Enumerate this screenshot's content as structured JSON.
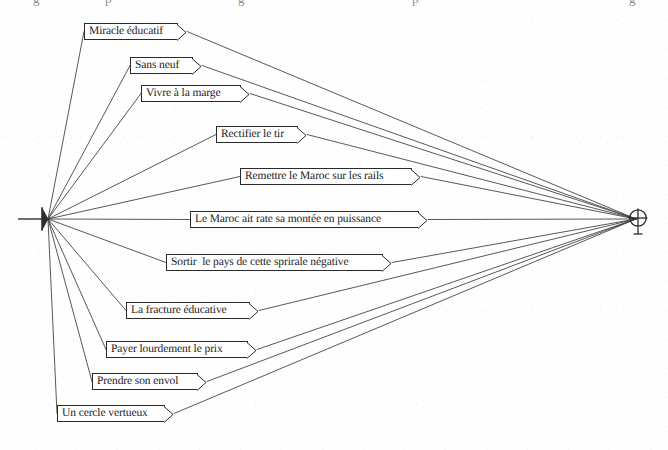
{
  "diagram": {
    "type": "radial-link-diagram",
    "title": "",
    "source_node": {
      "name": "left-hub",
      "symbol": "converging-arrow",
      "x": 45,
      "y": 219
    },
    "target_node": {
      "name": "right-hub",
      "symbol": "circle-plus",
      "label": "⊕",
      "x": 638,
      "y": 219
    },
    "edge_color": "#3a3a3a",
    "box_border_color": "#2a2a2a",
    "box_fill_color": "#ffffff",
    "text_color": "#1a1a1a",
    "background_color": "#fefefe",
    "nodes": [
      {
        "id": "n1",
        "label": "Miracle éducatif",
        "x": 84,
        "y": 23,
        "width": 94
      },
      {
        "id": "n2",
        "label": "Sans neuf",
        "x": 130,
        "y": 57,
        "width": 63
      },
      {
        "id": "n3",
        "label": "Vivre à la marge",
        "x": 141,
        "y": 85,
        "width": 100
      },
      {
        "id": "n4",
        "label": "Rectifier le tir",
        "x": 216,
        "y": 126,
        "width": 82
      },
      {
        "id": "n5",
        "label": "Remettre le Maroc sur les rails",
        "x": 240,
        "y": 168,
        "width": 172
      },
      {
        "id": "n6",
        "label": "Le Maroc ait rate sa montée en puissance",
        "x": 190,
        "y": 211,
        "width": 229
      },
      {
        "id": "n7",
        "label": "Sortir  le pays de cette sprirale négative",
        "x": 166,
        "y": 254,
        "width": 217
      },
      {
        "id": "n8",
        "label": "La fracture éducative",
        "x": 126,
        "y": 302,
        "width": 124
      },
      {
        "id": "n9",
        "label": "Payer lourdement le prix",
        "x": 106,
        "y": 341,
        "width": 142
      },
      {
        "id": "n10",
        "label": "Prendre son envol",
        "x": 92,
        "y": 373,
        "width": 106
      },
      {
        "id": "n11",
        "label": "Un cercle vertueux",
        "x": 57,
        "y": 405,
        "width": 108
      }
    ],
    "top_fragments": [
      {
        "text": "g",
        "x": 33
      },
      {
        "text": "p",
        "x": 105
      },
      {
        "text": "g",
        "x": 238
      },
      {
        "text": "p",
        "x": 412
      },
      {
        "text": "g",
        "x": 629
      }
    ]
  }
}
